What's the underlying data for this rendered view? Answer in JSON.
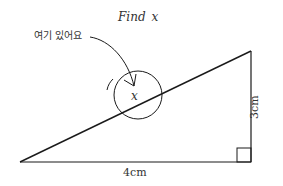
{
  "title": "Find x",
  "title_parts": {
    "word": "Find",
    "var": "x"
  },
  "annotation": {
    "text": "여기 있어요"
  },
  "circle_label": "x",
  "labels": {
    "vertical_side": "3cm",
    "horizontal_side": "4cm"
  },
  "colors": {
    "line": "#1a1a1a",
    "text": "#333333",
    "background": "#ffffff"
  },
  "geometry": {
    "left_vertex": [
      20,
      162
    ],
    "top_right_vertex": [
      251,
      51
    ],
    "bottom_right_vertex": [
      251,
      162
    ],
    "right_angle_box": [
      237,
      148,
      14,
      14
    ],
    "circle_center": [
      138,
      95
    ],
    "circle_radius": 24
  }
}
